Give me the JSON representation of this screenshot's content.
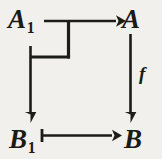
{
  "figure": {
    "kind": "commutative-diagram",
    "background_color": "#f2f0ec",
    "ink_color": "#1c1c19"
  },
  "nodes": [
    {
      "id": "A1",
      "base": "A",
      "subscript": "1",
      "position": "top-left"
    },
    {
      "id": "A",
      "base": "A",
      "subscript": "",
      "position": "top-right"
    },
    {
      "id": "B1",
      "base": "B",
      "subscript": "1",
      "position": "bottom-left"
    },
    {
      "id": "B",
      "base": "B",
      "subscript": "",
      "position": "bottom-right"
    }
  ],
  "edges": [
    {
      "id": "top",
      "from": "A1",
      "to": "A",
      "label": "",
      "style": "plain-arrow",
      "direction": "right"
    },
    {
      "id": "right",
      "from": "A",
      "to": "B",
      "label": "f",
      "style": "plain-arrow",
      "direction": "down"
    },
    {
      "id": "left",
      "from": "A1",
      "to": "B1",
      "label": "",
      "style": "plain-arrow",
      "direction": "down"
    },
    {
      "id": "bottom",
      "from": "B1",
      "to": "B",
      "label": "",
      "style": "barred-tail-arrow",
      "direction": "right"
    }
  ],
  "markers": [
    {
      "id": "pullback-corner",
      "description": "right-angle corner bracket indicating pullback square",
      "near": "A1"
    }
  ],
  "labels": {
    "A1_base": "A",
    "A1_sub": "1",
    "A_base": "A",
    "B1_base": "B",
    "B1_sub": "1",
    "B_base": "B",
    "f": "f"
  }
}
